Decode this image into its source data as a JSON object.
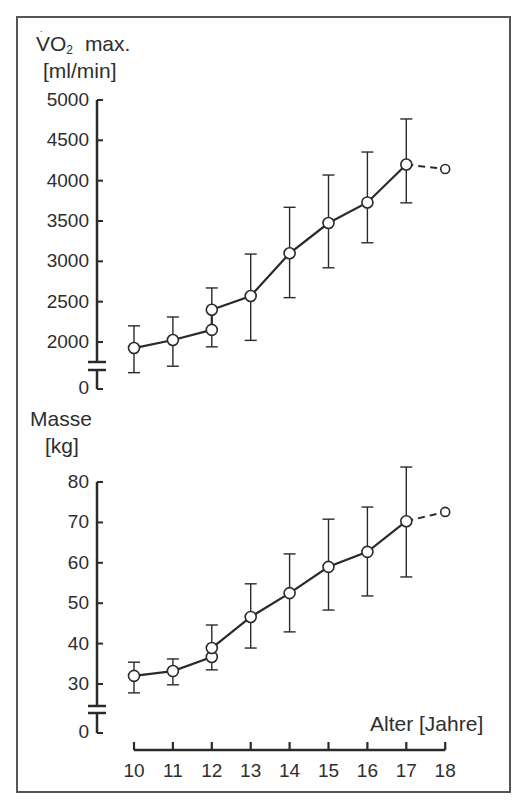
{
  "colors": {
    "ink": "#2a2a2a",
    "frame": "#555555",
    "background": "#ffffff"
  },
  "chart_data": [
    {
      "type": "line",
      "title": "",
      "ylabel_line1": "VO2 max.",
      "ylabel_main": "VO",
      "ylabel_sub": "2",
      "ylabel_suffix": "max.",
      "ylabel_unit": "[ml/min]",
      "xlabel": "Alter [Jahre]",
      "ylim": [
        0,
        5000
      ],
      "axis_break": true,
      "yticks": [
        0,
        2000,
        2500,
        3000,
        3500,
        4000,
        4500,
        5000
      ],
      "ytick_labels": [
        "0",
        "2000",
        "2500",
        "3000",
        "3500",
        "4000",
        "4500",
        "5000"
      ],
      "grid": false,
      "series": [
        {
          "name": "VO2 max",
          "points": [
            {
              "x": 10,
              "y": 1925,
              "err_low": 1620,
              "err_high": 2200
            },
            {
              "x": 11,
              "y": 2025,
              "err_low": 1700,
              "err_high": 2310
            },
            {
              "x": 12,
              "y": 2150,
              "err_low": 1940,
              "err_high": null
            },
            {
              "x": 12,
              "y": 2400,
              "err_low": null,
              "err_high": 2670
            },
            {
              "x": 13,
              "y": 2570,
              "err_low": 2020,
              "err_high": 3090
            },
            {
              "x": 14,
              "y": 3100,
              "err_low": 2550,
              "err_high": 3670
            },
            {
              "x": 15,
              "y": 3475,
              "err_low": 2920,
              "err_high": 4070
            },
            {
              "x": 16,
              "y": 3730,
              "err_low": 3230,
              "err_high": 4355
            },
            {
              "x": 17,
              "y": 4200,
              "err_low": 3725,
              "err_high": 4765
            }
          ],
          "dashed_extension": {
            "x": 18,
            "y": 4145
          }
        }
      ]
    },
    {
      "type": "line",
      "title": "",
      "ylabel_main": "Masse",
      "ylabel_unit": "[kg]",
      "xlabel": "Alter [Jahre]",
      "ylim": [
        0,
        80
      ],
      "axis_break": true,
      "yticks": [
        0,
        30,
        40,
        50,
        60,
        70,
        80
      ],
      "ytick_labels": [
        "0",
        "30",
        "40",
        "50",
        "60",
        "70",
        "80"
      ],
      "x": [
        10,
        11,
        12,
        13,
        14,
        15,
        16,
        17,
        18
      ],
      "xtick_labels": [
        "10",
        "11",
        "12",
        "13",
        "14",
        "15",
        "16",
        "17",
        "18"
      ],
      "grid": false,
      "series": [
        {
          "name": "Masse",
          "points": [
            {
              "x": 10,
              "y": 32,
              "err_low": 27.8,
              "err_high": 35.4
            },
            {
              "x": 11,
              "y": 33.2,
              "err_low": 29.8,
              "err_high": 36.2
            },
            {
              "x": 12,
              "y": 36.7,
              "err_low": 33.5,
              "err_high": null
            },
            {
              "x": 12,
              "y": 38.9,
              "err_low": null,
              "err_high": 44.6
            },
            {
              "x": 13,
              "y": 46.6,
              "err_low": 38.9,
              "err_high": 54.8
            },
            {
              "x": 14,
              "y": 52.5,
              "err_low": 42.9,
              "err_high": 62.2
            },
            {
              "x": 15,
              "y": 59,
              "err_low": 48.3,
              "err_high": 70.8
            },
            {
              "x": 16,
              "y": 62.7,
              "err_low": 51.8,
              "err_high": 73.8
            },
            {
              "x": 17,
              "y": 70.3,
              "err_low": 56.5,
              "err_high": 83.7
            }
          ],
          "dashed_extension": {
            "x": 18,
            "y": 72.6
          }
        }
      ]
    }
  ],
  "labels": {
    "top_ylabel_vo": "VO",
    "top_ylabel_sub": "2",
    "top_ylabel_max": "max.",
    "top_ylabel_unit": "[ml/min]",
    "bottom_ylabel": "Masse",
    "bottom_ylabel_unit": "[kg]",
    "xlabel": "Alter [Jahre]"
  }
}
